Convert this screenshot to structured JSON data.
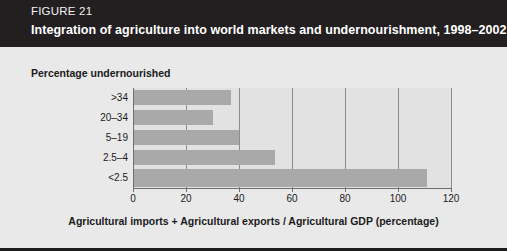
{
  "figure": {
    "number_label": "FIGURE 21",
    "title": "Integration of agriculture into world markets and undernourishment, 1998–2002",
    "header_bg": "#231f20",
    "body_bg": "#e9e9e9"
  },
  "chart_data": {
    "type": "bar",
    "orientation": "horizontal",
    "title": "Integration of agriculture into world markets and undernourishment, 1998–2002",
    "ylabel": "Percentage undernourished",
    "xlabel": "Agricultural imports + Agricultural exports / Agricultural GDP (percentage)",
    "categories": [
      "<2.5",
      "2.5–4",
      "5–19",
      "20–34",
      ">34"
    ],
    "values": [
      111,
      53.5,
      40,
      30,
      37
    ],
    "xlim": [
      0,
      120
    ],
    "xticks": [
      0,
      20,
      40,
      60,
      80,
      100,
      120
    ],
    "xtick_labels": [
      "0",
      "20",
      "40",
      "60",
      "80",
      "100",
      "120"
    ],
    "grid": "vertical-at-xticks",
    "legend": "none",
    "bar_color": "#a9a9a9",
    "plot_bg": "#e2e2e2",
    "series": [
      {
        "name": "Agricultural trade openness",
        "points": [
          {
            "category": ">34",
            "value": 37
          },
          {
            "category": "20–34",
            "value": 30
          },
          {
            "category": "5–19",
            "value": 40
          },
          {
            "category": "2.5–4",
            "value": 53.5
          },
          {
            "category": "<2.5",
            "value": 111
          }
        ]
      }
    ],
    "rows_top_to_bottom": [
      {
        "category": ">34",
        "value": 37
      },
      {
        "category": "20–34",
        "value": 30
      },
      {
        "category": "5–19",
        "value": 40
      },
      {
        "category": "2.5–4",
        "value": 53.5
      },
      {
        "category": "<2.5",
        "value": 111
      }
    ]
  }
}
